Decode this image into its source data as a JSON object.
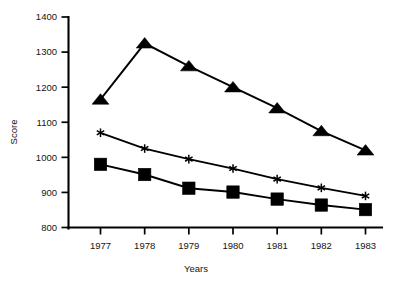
{
  "chart_data": {
    "type": "line",
    "title": "",
    "xlabel": "Years",
    "ylabel": "Score",
    "categories": [
      "1977",
      "1978",
      "1979",
      "1980",
      "1981",
      "1982",
      "1983"
    ],
    "x": [
      1977,
      1978,
      1979,
      1980,
      1981,
      1982,
      1983
    ],
    "ylim": [
      800,
      1400
    ],
    "yticks": [
      800,
      900,
      1000,
      1100,
      1200,
      1300,
      1400
    ],
    "ytick_labels": [
      "800",
      "900",
      "1000",
      "1100",
      "1200",
      "1300",
      "1400"
    ],
    "grid": false,
    "legend": "none",
    "series": [
      {
        "name": "triangle-series",
        "marker": "triangle",
        "color": "#000000",
        "values": [
          1165,
          1325,
          1260,
          1200,
          1140,
          1075,
          1020
        ]
      },
      {
        "name": "star-series",
        "marker": "asterisk",
        "color": "#000000",
        "values": [
          1070,
          1025,
          995,
          968,
          938,
          913,
          890
        ]
      },
      {
        "name": "square-series",
        "marker": "square",
        "color": "#000000",
        "values": [
          980,
          951,
          912,
          901,
          881,
          864,
          851
        ]
      }
    ]
  },
  "axes": {
    "y_axis_title": "Score",
    "x_axis_title": "Years"
  }
}
